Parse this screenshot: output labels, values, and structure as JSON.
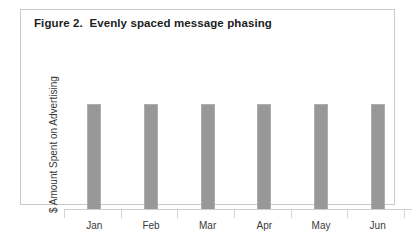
{
  "figure": {
    "title": "Figure 2.  Evenly spaced message phasing",
    "border_color": "#c9c9c9",
    "background": "#ffffff"
  },
  "axes": {
    "y_label": "$ Amount Spent on Advertising",
    "x_label": "",
    "axis_line_color": "#d0d0d0",
    "tick_color": "#d4d4d4"
  },
  "chart_data": {
    "type": "bar",
    "title": "Figure 2.  Evenly spaced message phasing",
    "subtitle": "",
    "xlabel": "",
    "ylabel": "$ Amount Spent on Advertising",
    "categories": [
      "Jan",
      "Feb",
      "Mar",
      "Apr",
      "May",
      "Jun"
    ],
    "values": [
      100,
      100,
      100,
      100,
      100,
      100
    ],
    "ylim": [
      0,
      140
    ],
    "grid": false,
    "legend": false,
    "legend_position": "none",
    "bar_color": "#989898",
    "bar_edge_color": "#aeaeae",
    "annotations": []
  }
}
